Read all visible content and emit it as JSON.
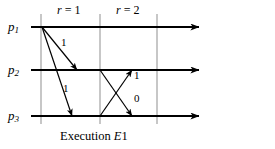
{
  "figure": {
    "caption_prefix": "Execution ",
    "caption_exec_symbol": "E",
    "caption_exec_index": "1",
    "caption_full": "Execution E1",
    "stroke_color": "#000000",
    "grid_color": "#8c8c8c",
    "background_color": "#ffffff"
  },
  "processes": [
    {
      "id": "p1",
      "name": "p",
      "subscript": "1",
      "y": 27
    },
    {
      "id": "p2",
      "name": "p",
      "subscript": "2",
      "y": 70
    },
    {
      "id": "p3",
      "name": "p",
      "subscript": "3",
      "y": 116
    }
  ],
  "rounds": [
    {
      "id": "r1",
      "var": "r",
      "eq": " = ",
      "value": "1",
      "label": "r = 1",
      "start_x": 41,
      "end_x": 100
    },
    {
      "id": "r2",
      "var": "r",
      "eq": " = ",
      "value": "2",
      "label": "r = 2",
      "start_x": 100,
      "end_x": 157
    }
  ],
  "round_boundaries": [
    41,
    100,
    157
  ],
  "messages": [
    {
      "id": "m1",
      "from": "p1",
      "to": "p2",
      "value": "1",
      "round": "r1",
      "x1": 42,
      "y1": 27,
      "x2": 77,
      "y2": 70
    },
    {
      "id": "m2",
      "from": "p1",
      "to": "p3",
      "value": "1",
      "round": "r1",
      "x1": 42,
      "y1": 27,
      "x2": 72,
      "y2": 116
    },
    {
      "id": "m3",
      "from": "p3",
      "to": "p2",
      "value": "1",
      "round": "r2",
      "x1": 100,
      "y1": 116,
      "x2": 132,
      "y2": 70
    },
    {
      "id": "m4",
      "from": "p2",
      "to": "p3",
      "value": "0",
      "round": "r2",
      "x1": 100,
      "y1": 70,
      "x2": 132,
      "y2": 116
    }
  ],
  "message_labels": [
    {
      "id": "lbl-m1",
      "text": "1",
      "x": 61,
      "y": 37
    },
    {
      "id": "lbl-m2",
      "text": "1",
      "x": 63,
      "y": 83
    },
    {
      "id": "lbl-m3",
      "text": "1",
      "x": 134,
      "y": 70
    },
    {
      "id": "lbl-m4",
      "text": "0",
      "x": 134,
      "y": 93
    }
  ],
  "round_label_positions": [
    {
      "id": "pos-r1",
      "x": 57,
      "y": 5
    },
    {
      "id": "pos-r2",
      "x": 116,
      "y": 5
    }
  ],
  "timeline": {
    "x_start": 41,
    "x_end": 207
  }
}
